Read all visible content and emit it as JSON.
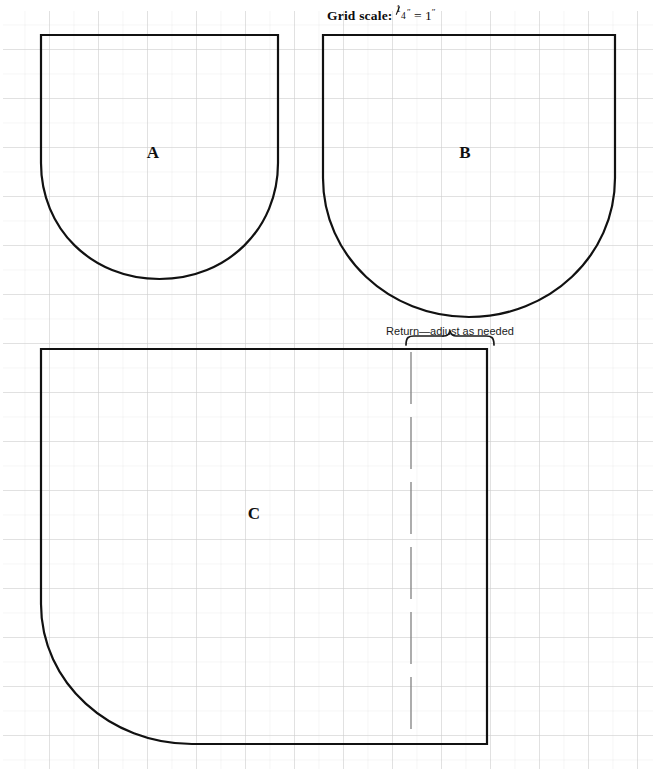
{
  "document": {
    "type": "sewing-pattern-grid-diagram",
    "background_color": "#ffffff",
    "width": 653,
    "height": 769
  },
  "title": {
    "bold_prefix": "Grid scale:",
    "fraction_numerator": "1",
    "fraction_denominator": "4",
    "inch_mark_after_fraction": "″",
    "equals": "=",
    "value": "1",
    "inch_mark_after_value": "″",
    "full_text": "Grid scale: 1/4″ = 1″"
  },
  "grid": {
    "minor_cell_px": 24.5,
    "minor_color": "#e9e9e9",
    "major_color": "#c9c9c9",
    "major_every": 2
  },
  "ink": {
    "outline_color": "#111111",
    "outline_width": 2.2,
    "dash_color": "#8a8a8a",
    "brace_color": "#1a1a1a"
  },
  "shapes": [
    {
      "id": "A",
      "label": "A",
      "label_x": 153,
      "label_y": 152,
      "description": "U-shaped panel, flat top, rounded bottom",
      "bbox": {
        "left": 41,
        "top": 34,
        "right": 278,
        "bottom": 280
      },
      "path": "M 41 35 L 278 35 L 278 163 C 278 228 228 279 159.5 279 C 91 279 41 228 41 163 Z"
    },
    {
      "id": "B",
      "label": "B",
      "label_x": 465,
      "label_y": 152,
      "description": "U-shaped panel, flat top, deeper rounded bottom",
      "bbox": {
        "left": 323,
        "top": 34,
        "right": 615,
        "bottom": 318
      },
      "path": "M 323 35 L 615 35 L 615 178 C 615 256 549 317 469 317 C 389 317 323 256 323 178 Z"
    },
    {
      "id": "C",
      "label": "C",
      "label_x": 254,
      "label_y": 513,
      "description": "Large rectangular panel with one large radius at bottom-left corner",
      "bbox": {
        "left": 41,
        "top": 348,
        "right": 488,
        "bottom": 745
      },
      "path": "M 41 349 L 487 349 L 487 744 L 192 744 C 110 744 41 683 41 604 Z"
    }
  ],
  "fold_line": {
    "name": "return-fold-line",
    "style": "long-dashed",
    "x": 411,
    "y_top": 352,
    "y_bottom": 742,
    "dash_pattern": "52 13"
  },
  "return_callout": {
    "label": "Return—adjust as needed",
    "label_x": 450,
    "label_y": 331,
    "brace": {
      "left": 406,
      "right": 494,
      "y": 345,
      "depth": 9
    }
  }
}
